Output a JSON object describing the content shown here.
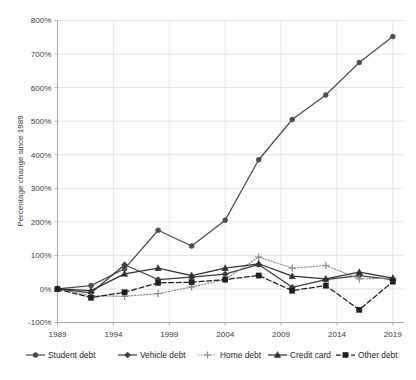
{
  "chart_data": {
    "type": "line",
    "title": "",
    "subtitle": "",
    "xlabel": "",
    "ylabel": "Percentage change since 1989",
    "x": [
      1989,
      1992,
      1995,
      1998,
      2001,
      2004,
      2007,
      2010,
      2013,
      2016,
      2019
    ],
    "xlim": [
      1989,
      2020
    ],
    "ylim": [
      -100,
      800
    ],
    "x_tick_labels": [
      "1989",
      "1994",
      "1999",
      "2004",
      "2009",
      "2014",
      "2019"
    ],
    "x_tick_values": [
      1989,
      1994,
      1999,
      2004,
      2009,
      2014,
      2019
    ],
    "y_tick_labels": [
      "-100%",
      "0%",
      "100%",
      "200%",
      "300%",
      "400%",
      "500%",
      "600%",
      "700%",
      "800%"
    ],
    "y_tick_values": [
      -100,
      0,
      100,
      200,
      300,
      400,
      500,
      600,
      700,
      800
    ],
    "y_tick_step": 100,
    "grid": true,
    "legend_position": "bottom",
    "series": [
      {
        "name": "Student debt",
        "marker": "circle",
        "line_style": "solid",
        "color": "#4c4c4c",
        "values": [
          0,
          10,
          60,
          175,
          128,
          205,
          385,
          505,
          578,
          675,
          752
        ]
      },
      {
        "name": "Vehicle debt",
        "marker": "diamond",
        "line_style": "solid",
        "color": "#3d3d3d",
        "values": [
          0,
          -12,
          72,
          28,
          35,
          44,
          73,
          5,
          28,
          40,
          28
        ]
      },
      {
        "name": "Home debt",
        "marker": "plus",
        "line_style": "dotted",
        "color": "#8c8c8c",
        "values": [
          0,
          -20,
          -22,
          -14,
          6,
          28,
          95,
          62,
          70,
          30,
          32
        ]
      },
      {
        "name": "Credit card",
        "marker": "triangle",
        "line_style": "solid",
        "color": "#313131",
        "values": [
          0,
          -5,
          45,
          62,
          40,
          62,
          75,
          38,
          30,
          50,
          32
        ]
      },
      {
        "name": "Other debt",
        "marker": "square",
        "line_style": "dashed",
        "color": "#1f1f1f",
        "values": [
          0,
          -26,
          -10,
          18,
          20,
          28,
          40,
          -5,
          10,
          -62,
          22
        ]
      }
    ]
  },
  "legend": {
    "items": [
      {
        "label": "Student debt"
      },
      {
        "label": "Vehicle debt"
      },
      {
        "label": "Home debt"
      },
      {
        "label": "Credit card"
      },
      {
        "label": "Other debt"
      }
    ]
  },
  "axes": {
    "y_title": "Percentage change since 1989"
  }
}
